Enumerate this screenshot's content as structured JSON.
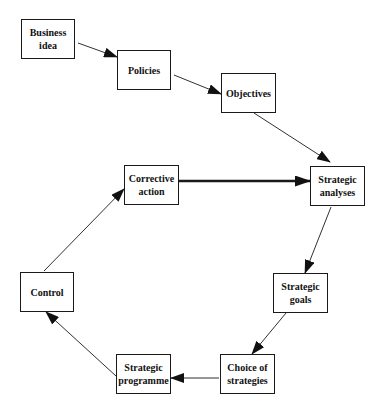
{
  "diagram": {
    "type": "process-cycle",
    "nodes": [
      {
        "id": "business_idea",
        "label": "Business\nidea",
        "x": 21,
        "y": 19,
        "w": 54,
        "h": 40
      },
      {
        "id": "policies",
        "label": "Policies",
        "x": 117,
        "y": 50,
        "w": 54,
        "h": 40
      },
      {
        "id": "objectives",
        "label": "Objectives",
        "x": 221,
        "y": 73,
        "w": 55,
        "h": 40
      },
      {
        "id": "strategic_analyses",
        "label": "Strategic\nanalyses",
        "x": 310,
        "y": 166,
        "w": 55,
        "h": 40
      },
      {
        "id": "strategic_goals",
        "label": "Strategic\ngoals",
        "x": 273,
        "y": 273,
        "w": 55,
        "h": 40
      },
      {
        "id": "choice_of_strategies",
        "label": "Choice of\nstrategies",
        "x": 220,
        "y": 354,
        "w": 55,
        "h": 40
      },
      {
        "id": "strategic_programme",
        "label": "Strategic\nprogramme",
        "x": 116,
        "y": 354,
        "w": 55,
        "h": 40
      },
      {
        "id": "control",
        "label": "Control",
        "x": 20,
        "y": 272,
        "w": 54,
        "h": 40
      },
      {
        "id": "corrective_action",
        "label": "Corrective\naction",
        "x": 124,
        "y": 165,
        "w": 55,
        "h": 40
      }
    ],
    "edges": [
      {
        "from": "business_idea",
        "to": "policies",
        "x1": 78,
        "y1": 43,
        "x2": 117,
        "y2": 57,
        "weight": "thin"
      },
      {
        "from": "policies",
        "to": "objectives",
        "x1": 174,
        "y1": 75,
        "x2": 221,
        "y2": 94,
        "weight": "thin"
      },
      {
        "from": "objectives",
        "to": "strategic_analyses",
        "x1": 254,
        "y1": 113,
        "x2": 330,
        "y2": 162,
        "weight": "thin"
      },
      {
        "from": "corrective_action",
        "to": "strategic_analyses",
        "x1": 179,
        "y1": 181,
        "x2": 310,
        "y2": 181,
        "weight": "thick"
      },
      {
        "from": "strategic_analyses",
        "to": "strategic_goals",
        "x1": 331,
        "y1": 207,
        "x2": 305,
        "y2": 273,
        "weight": "thin"
      },
      {
        "from": "strategic_goals",
        "to": "choice_of_strategies",
        "x1": 286,
        "y1": 313,
        "x2": 252,
        "y2": 354,
        "weight": "thin"
      },
      {
        "from": "choice_of_strategies",
        "to": "strategic_programme",
        "x1": 219,
        "y1": 378,
        "x2": 171,
        "y2": 378,
        "weight": "thin"
      },
      {
        "from": "strategic_programme",
        "to": "control",
        "x1": 116,
        "y1": 376,
        "x2": 46,
        "y2": 312,
        "weight": "thin"
      },
      {
        "from": "control",
        "to": "corrective_action",
        "x1": 44,
        "y1": 271,
        "x2": 124,
        "y2": 189,
        "weight": "thin"
      }
    ],
    "colors": {
      "stroke": "#1a1a1a",
      "background": "#ffffff",
      "text": "#111111"
    }
  }
}
